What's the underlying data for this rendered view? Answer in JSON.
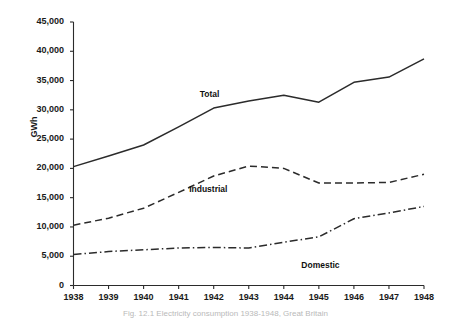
{
  "chart_data": {
    "type": "line",
    "title": "",
    "xlabel": "",
    "ylabel": "GWh",
    "x": [
      1938,
      1939,
      1940,
      1941,
      1942,
      1943,
      1944,
      1945,
      1946,
      1947,
      1948
    ],
    "categories": [
      "1938",
      "1939",
      "1940",
      "1941",
      "1942",
      "1943",
      "1944",
      "1945",
      "1946",
      "1947",
      "1948"
    ],
    "xlim": [
      1938,
      1948
    ],
    "ylim": [
      0,
      45000
    ],
    "yticks": [
      0,
      5000,
      10000,
      15000,
      20000,
      25000,
      30000,
      35000,
      40000,
      45000
    ],
    "ytick_labels": [
      "0",
      "5,000",
      "10,000",
      "15,000",
      "20,000",
      "25,000",
      "30,000",
      "35,000",
      "40,000",
      "45,000"
    ],
    "grid": false,
    "legend_position": "inline-annotations",
    "series": [
      {
        "name": "Total",
        "style": "solid",
        "color": "#2b2b2b",
        "values": [
          20300,
          22100,
          24000,
          27100,
          30300,
          31500,
          32500,
          31300,
          34700,
          35600,
          38700
        ]
      },
      {
        "name": "Industrial",
        "style": "dashed",
        "color": "#2b2b2b",
        "values": [
          10300,
          11500,
          13200,
          15900,
          18700,
          20400,
          20000,
          17500,
          17500,
          17600,
          19000
        ]
      },
      {
        "name": "Domestic",
        "style": "dash-dot",
        "color": "#2b2b2b",
        "values": [
          5300,
          5800,
          6100,
          6400,
          6500,
          6400,
          7400,
          8300,
          11400,
          12400,
          13500
        ]
      }
    ],
    "annotations": [
      {
        "name": "Total",
        "text": "Total",
        "x": 1941.6,
        "y": 33600
      },
      {
        "name": "Industrial",
        "text": "Industrial",
        "x": 1941.3,
        "y": 17400
      },
      {
        "name": "Domestic",
        "text": "Domestic",
        "x": 1944.5,
        "y": 4400
      }
    ]
  },
  "caption": {
    "text": "Fig. 12.1  Electricity consumption 1938-1948, Great Britain"
  }
}
